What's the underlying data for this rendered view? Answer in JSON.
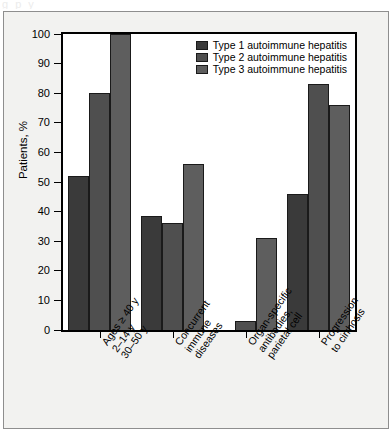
{
  "top_cutoff_text": "g         p  y",
  "chart_data": {
    "type": "bar",
    "title": "",
    "subtitle": "",
    "xlabel": "",
    "ylabel": "Patients, %",
    "ylim": [
      0,
      100
    ],
    "ytick_values": [
      0,
      10,
      20,
      30,
      40,
      50,
      60,
      70,
      80,
      90,
      100
    ],
    "ytick_labels": [
      "0",
      "10",
      "20",
      "30",
      "40",
      "50",
      "60",
      "70",
      "80",
      "90",
      "100"
    ],
    "grid": false,
    "legend_position": "top-right inside plot",
    "categories": [
      [
        "Ages ≥ 40 y",
        "2–14 y",
        "30–50 y"
      ],
      [
        "Concurrent",
        "immune",
        "diseases"
      ],
      [
        "Organ-specific",
        "antibodies,",
        "parietal cell"
      ],
      [
        "Progression",
        "to cirrhosis"
      ]
    ],
    "series": [
      {
        "name": "Type 1 autoimmune hepatitis",
        "color": "#3a3a3a",
        "values": [
          52,
          38.5,
          0,
          46
        ]
      },
      {
        "name": "Type 2 autoimmune hepatitis",
        "color": "#4f4f4f",
        "values": [
          80,
          36,
          3,
          83
        ]
      },
      {
        "name": "Type 3 autoimmune hepatitis",
        "color": "#5e5e5e",
        "values": [
          100,
          56,
          31,
          76
        ]
      }
    ]
  }
}
